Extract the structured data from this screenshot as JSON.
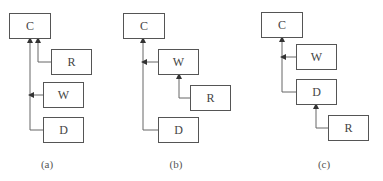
{
  "panels": [
    {
      "caption": "(a)",
      "boxes": [
        {
          "id": "C",
          "label": "C"
        },
        {
          "id": "R",
          "label": "R"
        },
        {
          "id": "W",
          "label": "W"
        },
        {
          "id": "D",
          "label": "D"
        }
      ],
      "edges": [
        [
          "R",
          "C"
        ],
        [
          "W",
          "C"
        ],
        [
          "D",
          "C"
        ]
      ]
    },
    {
      "caption": "(b)",
      "boxes": [
        {
          "id": "C",
          "label": "C"
        },
        {
          "id": "W",
          "label": "W"
        },
        {
          "id": "R",
          "label": "R"
        },
        {
          "id": "D",
          "label": "D"
        }
      ],
      "edges": [
        [
          "W",
          "C"
        ],
        [
          "R",
          "W"
        ],
        [
          "D",
          "C"
        ]
      ]
    },
    {
      "caption": "(c)",
      "boxes": [
        {
          "id": "C",
          "label": "C"
        },
        {
          "id": "W",
          "label": "W"
        },
        {
          "id": "D",
          "label": "D"
        },
        {
          "id": "R",
          "label": "R"
        }
      ],
      "edges": [
        [
          "W",
          "C"
        ],
        [
          "D",
          "C"
        ],
        [
          "R",
          "D"
        ]
      ]
    }
  ],
  "colors": {
    "line": "#555555",
    "box_border": "#555555"
  }
}
